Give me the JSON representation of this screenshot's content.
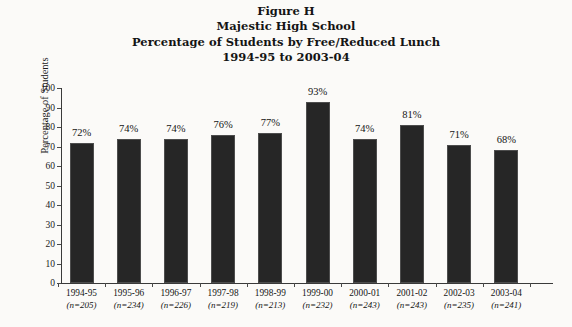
{
  "figure": {
    "title_lines": [
      "Figure H",
      "Majestic High School",
      "Percentage of Students by Free/Reduced Lunch",
      "1994-95 to 2003-04"
    ]
  },
  "chart_data": {
    "type": "bar",
    "title": "Figure H Majestic High School Percentage of Students by Free/Reduced Lunch 1994-95 to 2003-04",
    "xlabel": "",
    "ylabel": "Percentage of Students",
    "ylim": [
      0,
      100
    ],
    "ytick_step": 10,
    "yticks": [
      "100",
      "90",
      "80",
      "70",
      "60",
      "50",
      "40",
      "30",
      "20",
      "10",
      "0"
    ],
    "grid": false,
    "legend": "none",
    "bar_color": "#262626",
    "categories": [
      "1994-95",
      "1995-96",
      "1996-97",
      "1997-98",
      "1998-99",
      "1999-00",
      "2000-01",
      "2001-02",
      "2002-03",
      "2003-04"
    ],
    "sample_sizes": [
      "(n=205)",
      "(n=234)",
      "(n=226)",
      "(n=219)",
      "(n=213)",
      "(n=232)",
      "(n=243)",
      "(n=243)",
      "(n=235)",
      "(n=241)"
    ],
    "values": [
      72,
      74,
      74,
      76,
      77,
      93,
      74,
      81,
      71,
      68
    ],
    "value_labels": [
      "72%",
      "74%",
      "74%",
      "76%",
      "77%",
      "93%",
      "74%",
      "81%",
      "71%",
      "68%"
    ]
  }
}
